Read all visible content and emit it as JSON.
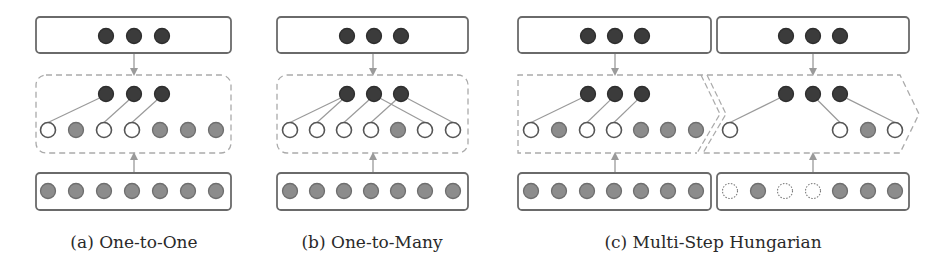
{
  "colors": {
    "dark": "#3b3b3b",
    "gray": "#8c8c8c",
    "white": "#ffffff",
    "stroke": "#555555",
    "frame": "#6a6a6a",
    "dashed": "#aaaaaa",
    "line": "#9a9a9a",
    "arrow": "#9a9a9a"
  },
  "panels": [
    {
      "id": "a",
      "caption": "(a) One-to-One",
      "caption_x": 134,
      "box_x": 36,
      "box_w": 195,
      "nodes_x": [
        48,
        76,
        104,
        132,
        160,
        188,
        216
      ],
      "dark_x": [
        106,
        134,
        162
      ],
      "arrow_x": 134,
      "middle_row": [
        "white",
        "gray",
        "white",
        "white",
        "gray",
        "gray",
        "gray"
      ],
      "bottom_row": [
        "gray",
        "gray",
        "gray",
        "gray",
        "gray",
        "gray",
        "gray"
      ],
      "links": [
        [
          0,
          0
        ],
        [
          1,
          2
        ],
        [
          2,
          3
        ]
      ],
      "region": "rounded"
    },
    {
      "id": "b",
      "caption": "(b) One-to-Many",
      "caption_x": 372,
      "box_x": 277,
      "box_w": 191,
      "nodes_x": [
        290,
        317,
        344,
        371,
        398,
        425,
        453
      ],
      "dark_x": [
        347,
        374,
        401
      ],
      "arrow_x": 373,
      "middle_row": [
        "white",
        "white",
        "white",
        "white",
        "gray",
        "white",
        "white"
      ],
      "bottom_row": [
        "gray",
        "gray",
        "gray",
        "gray",
        "gray",
        "gray",
        "gray"
      ],
      "links": [
        [
          0,
          0
        ],
        [
          0,
          1
        ],
        [
          1,
          2
        ],
        [
          1,
          5
        ],
        [
          2,
          3
        ],
        [
          2,
          6
        ]
      ],
      "region": "rounded"
    },
    {
      "id": "c1",
      "caption": "",
      "box_x": 518,
      "box_w": 193,
      "nodes_x": [
        531,
        559,
        587,
        614,
        641,
        668,
        696
      ],
      "dark_x": [
        588,
        615,
        642
      ],
      "arrow_x": 615,
      "middle_row": [
        "white",
        "gray",
        "white",
        "white",
        "gray",
        "gray",
        "gray"
      ],
      "bottom_row": [
        "gray",
        "gray",
        "gray",
        "gray",
        "gray",
        "gray",
        "gray"
      ],
      "links": [
        [
          0,
          0
        ],
        [
          1,
          2
        ],
        [
          2,
          3
        ]
      ],
      "region": "chevron-first"
    },
    {
      "id": "c2",
      "caption": "",
      "box_x": 717,
      "box_w": 192,
      "nodes_x": [
        730,
        758,
        785,
        813,
        840,
        868,
        895
      ],
      "dark_x": [
        786,
        813,
        840
      ],
      "arrow_x": 813,
      "middle_row": [
        "white",
        "none",
        "none",
        "none",
        "white",
        "gray",
        "white"
      ],
      "bottom_row": [
        "dotted",
        "gray",
        "dotted",
        "dotted",
        "gray",
        "gray",
        "gray"
      ],
      "links": [
        [
          0,
          0
        ],
        [
          1,
          4
        ],
        [
          2,
          6
        ]
      ],
      "region": "chevron-second"
    }
  ],
  "captions": {
    "a": "(a) One-to-One",
    "b": "(b) One-to-Many",
    "c": "(c) Multi-Step Hungarian"
  },
  "caption_positions": {
    "a": 134,
    "b": 372,
    "c": 713
  },
  "layout": {
    "top_box_y": 17,
    "top_box_h": 36,
    "top_dark_y": 36,
    "region_y": 75,
    "region_h": 78,
    "mid_dark_y": 94,
    "mid_row_y": 130,
    "bottom_box_y": 173,
    "bottom_box_h": 37,
    "bottom_row_y": 191,
    "node_r": 7.5
  }
}
